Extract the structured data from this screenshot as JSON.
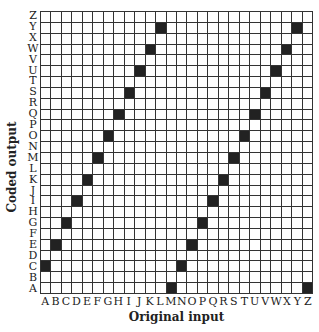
{
  "chart_data": {
    "type": "heatmap",
    "title": "",
    "xlabel": "Original input",
    "ylabel": "Coded output",
    "x_ticks": [
      "A",
      "B",
      "C",
      "D",
      "E",
      "F",
      "G",
      "H",
      "I",
      "J",
      "K",
      "L",
      "M",
      "N",
      "O",
      "P",
      "Q",
      "R",
      "S",
      "T",
      "U",
      "V",
      "W",
      "X",
      "Y",
      "Z"
    ],
    "y_ticks": [
      "A",
      "B",
      "C",
      "D",
      "E",
      "F",
      "G",
      "H",
      "I",
      "J",
      "K",
      "L",
      "M",
      "N",
      "O",
      "P",
      "Q",
      "R",
      "S",
      "T",
      "U",
      "V",
      "W",
      "X",
      "Y",
      "Z"
    ],
    "grid": true,
    "mapping": [
      {
        "input": "A",
        "output": "C"
      },
      {
        "input": "B",
        "output": "E"
      },
      {
        "input": "C",
        "output": "G"
      },
      {
        "input": "D",
        "output": "I"
      },
      {
        "input": "E",
        "output": "K"
      },
      {
        "input": "F",
        "output": "M"
      },
      {
        "input": "G",
        "output": "O"
      },
      {
        "input": "H",
        "output": "Q"
      },
      {
        "input": "I",
        "output": "S"
      },
      {
        "input": "J",
        "output": "U"
      },
      {
        "input": "K",
        "output": "W"
      },
      {
        "input": "L",
        "output": "Y"
      },
      {
        "input": "M",
        "output": "A"
      },
      {
        "input": "N",
        "output": "C"
      },
      {
        "input": "O",
        "output": "E"
      },
      {
        "input": "P",
        "output": "G"
      },
      {
        "input": "Q",
        "output": "I"
      },
      {
        "input": "R",
        "output": "K"
      },
      {
        "input": "S",
        "output": "M"
      },
      {
        "input": "T",
        "output": "O"
      },
      {
        "input": "U",
        "output": "Q"
      },
      {
        "input": "V",
        "output": "S"
      },
      {
        "input": "W",
        "output": "U"
      },
      {
        "input": "X",
        "output": "W"
      },
      {
        "input": "Y",
        "output": "Y"
      },
      {
        "input": "Z",
        "output": "A"
      }
    ],
    "colors": {
      "filled": "#222222",
      "empty": "#ffffff",
      "gridline": "#333333"
    }
  }
}
